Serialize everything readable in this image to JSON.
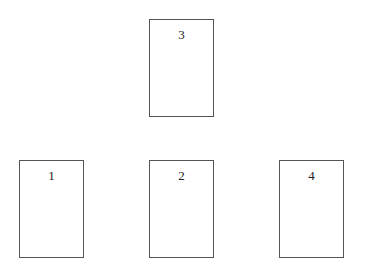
{
  "diagram": {
    "boxes": [
      {
        "id": "box-1",
        "label": "1"
      },
      {
        "id": "box-2",
        "label": "2"
      },
      {
        "id": "box-3",
        "label": "3"
      },
      {
        "id": "box-4",
        "label": "4"
      }
    ]
  },
  "colors": {
    "border": "#555555",
    "background": "#ffffff"
  }
}
